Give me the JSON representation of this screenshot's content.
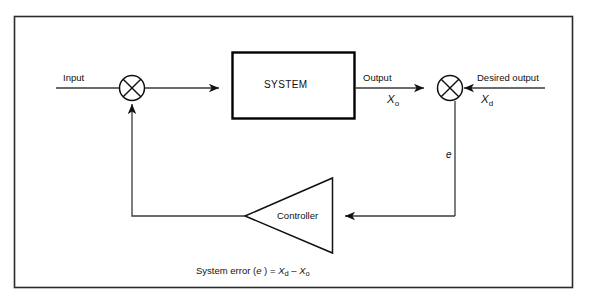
{
  "diagram": {
    "frame": {
      "stroke": "#2b2b2b"
    },
    "colors": {
      "line": "#3a3a3a",
      "block_border": "#000000",
      "text": "#111111",
      "background": "#ffffff"
    },
    "labels": {
      "input": "Input",
      "system_block": "SYSTEM",
      "output": "Output",
      "desired_output": "Desired output",
      "controller": "Controller",
      "error_symbol": "e",
      "output_var": "X",
      "output_var_sub": "o",
      "desired_var": "X",
      "desired_var_sub": "d"
    },
    "caption": {
      "prefix": "System error (",
      "error_symbol": "e",
      "mid": " ) = ",
      "term1_var": "X",
      "term1_sub": "d",
      "operator": " – ",
      "term2_var": "X",
      "term2_sub": "o"
    },
    "nodes": {
      "summing_junction_1": "summing-junction-input",
      "summing_junction_2": "summing-junction-error",
      "system_block": "system-block",
      "controller_block": "controller-block"
    }
  }
}
